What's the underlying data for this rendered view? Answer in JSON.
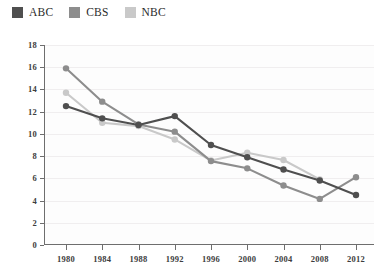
{
  "legend": {
    "position": "top-left",
    "items": [
      {
        "label": "ABC",
        "color": "#4f4f4f",
        "swatch": "legend-swatch-abc"
      },
      {
        "label": "CBS",
        "color": "#8d8d8d",
        "swatch": "legend-swatch-cbs"
      },
      {
        "label": "NBC",
        "color": "#c9c9c9",
        "swatch": "legend-swatch-nbc"
      }
    ]
  },
  "axes": {
    "y_ticks": [
      "18",
      "16",
      "14",
      "12",
      "10",
      "8",
      "6",
      "4",
      "2",
      "0"
    ],
    "x_ticks": [
      "1980",
      "1984",
      "1988",
      "1992",
      "1996",
      "2000",
      "2004",
      "2008",
      "2012"
    ]
  },
  "chart_data": {
    "type": "line",
    "title": "",
    "subtitle": "",
    "xlabel": "",
    "ylabel": "",
    "categories": [
      "1980",
      "1984",
      "1988",
      "1992",
      "1996",
      "2000",
      "2004",
      "2008",
      "2012"
    ],
    "x": [
      1980,
      1984,
      1988,
      1992,
      1996,
      2000,
      2004,
      2008,
      2012
    ],
    "ylim": [
      0,
      18
    ],
    "xlim": [
      1978,
      2014
    ],
    "ytick_step": 2,
    "grid": "horizontal",
    "legend_position": "top-left",
    "markers": "circle",
    "series": [
      {
        "name": "ABC",
        "color": "#4f4f4f",
        "values": [
          12.5,
          11.4,
          10.8,
          11.6,
          9.0,
          7.9,
          6.8,
          5.8,
          4.5
        ]
      },
      {
        "name": "CBS",
        "color": "#8d8d8d",
        "values": [
          15.9,
          12.9,
          10.85,
          10.2,
          7.55,
          6.9,
          5.35,
          4.15,
          6.1
        ]
      },
      {
        "name": "NBC",
        "color": "#c9c9c9",
        "values": [
          13.7,
          11.0,
          10.7,
          9.5,
          7.6,
          8.3,
          7.65,
          5.9,
          null
        ]
      }
    ]
  }
}
